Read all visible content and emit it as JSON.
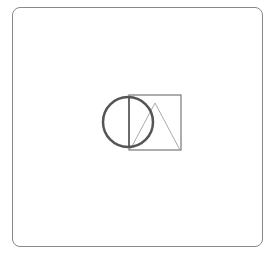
{
  "canvas": {
    "width": 271,
    "height": 257,
    "background": "#ffffff"
  },
  "frame": {
    "border_color": "#888888"
  },
  "shapes": {
    "circle": {
      "cx": 128,
      "cy": 122,
      "r": 25,
      "stroke": "#555555",
      "stroke_width": 2.5
    },
    "square": {
      "x": 129,
      "y": 95,
      "width": 52,
      "height": 55,
      "stroke": "#777777",
      "stroke_width": 1.2
    },
    "triangle": {
      "points": "130,150 155,103 180,150",
      "stroke": "#aaaaaa",
      "stroke_width": 1
    },
    "diameter_line": {
      "x1": 129,
      "y1": 97,
      "x2": 129,
      "y2": 148,
      "stroke": "#555555"
    }
  }
}
